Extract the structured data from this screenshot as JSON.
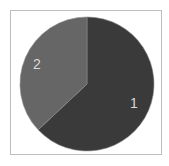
{
  "chart_data": {
    "type": "pie",
    "title": "",
    "categories": [
      "1",
      "2"
    ],
    "values": [
      63,
      37
    ],
    "colors": [
      "#3a3a3a",
      "#666666"
    ],
    "start_angle_deg": 0,
    "direction": "clockwise",
    "labels_shown": [
      "1",
      "2"
    ],
    "legend": null
  },
  "labels": {
    "slice1": "1",
    "slice2": "2"
  },
  "colors": {
    "frame_border": "#bdbdbd",
    "label_text": "#d8d8d8",
    "background": "#ffffff"
  }
}
